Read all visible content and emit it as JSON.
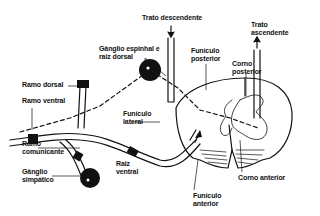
{
  "diagram": {
    "colors": {
      "ink": "#111111",
      "background": "#ffffff"
    },
    "labels": {
      "trato_descendente": "Trato descendente",
      "trato_ascendente": "Trato\nascendente",
      "ganglio_espinhal": "Gânglio espinhal e\nraiz dorsal",
      "funiculo_posterior": "Funículo\nposterior",
      "corno_posterior": "Corno\nposterior",
      "ramo_dorsal": "Ramo dorsal",
      "ramo_ventral": "Ramo ventral",
      "funiculo_lateral": "Funículo\nlateral",
      "ramo_comunicante": "Ramo\ncomunicante",
      "raiz_ventral": "Raiz\nventral",
      "ganglio_simpatico": "Gânglio\nsimpático",
      "corno_anterior": "Corno anterior",
      "funiculo_anterior": "Funículo\nanterior"
    }
  }
}
